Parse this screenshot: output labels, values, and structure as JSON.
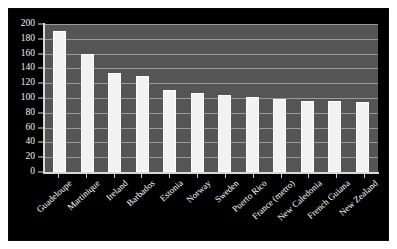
{
  "chart_data": {
    "type": "bar",
    "title": "",
    "subtitle": "",
    "xlabel": "",
    "ylabel": "",
    "categories": [
      "Guadeloupe",
      "Martinique",
      "Ireland",
      "Barbados",
      "Estonia",
      "Norway",
      "Sweden",
      "Puerto Rico",
      "France (metro)",
      "New Caledonia",
      "French Guiana",
      "New Zealand"
    ],
    "values": [
      191,
      159,
      134,
      130,
      111,
      107,
      104,
      101,
      98,
      96,
      96,
      94
    ],
    "ylim": [
      0,
      200
    ],
    "ytick_labels": [
      "200",
      "180",
      "160",
      "140",
      "120",
      "100",
      "80",
      "60",
      "40",
      "20",
      "0"
    ],
    "ytick_values": [
      200,
      180,
      160,
      140,
      120,
      100,
      80,
      60,
      40,
      20,
      0
    ],
    "grid": true,
    "legend": false,
    "legend_position": "none",
    "series": [
      {
        "name": "values",
        "values": [
          191,
          159,
          134,
          130,
          111,
          107,
          104,
          101,
          98,
          96,
          96,
          94
        ]
      }
    ]
  },
  "style": {
    "panel_background": "#000000",
    "plot_background": "#555555",
    "bar_color": "#f2f2f2",
    "gridline_color": "#9a9a9a",
    "axis_color": "#d8d8d8",
    "tick_label_color": "#f0f0f0",
    "category_label_color": "#ffffff"
  }
}
